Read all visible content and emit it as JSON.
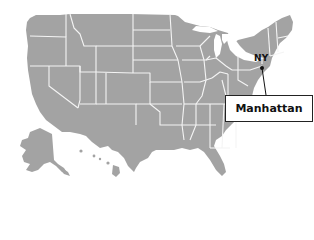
{
  "map": {
    "region": "United States",
    "land_color": "#a3a3a3",
    "border_color": "#f4f4f4",
    "marker": {
      "state_label": "NY",
      "place": "Manhattan",
      "marker_color": "#111111"
    }
  }
}
